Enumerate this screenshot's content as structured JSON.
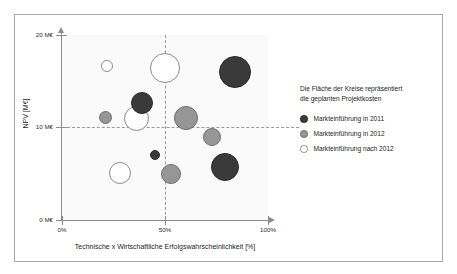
{
  "figure": {
    "background": "#ffffff",
    "border_color": "#a8a8a8",
    "plot_background": "#fafafa"
  },
  "legend": {
    "caption_line1": "Die Fläche der Kreise repräsentiert",
    "caption_line2": "die geplanten Projektkosten",
    "items": [
      {
        "label": "Markteinführung in 2011",
        "color": "#3a3a3a",
        "stroke": "#2a2a2a"
      },
      {
        "label": "Markteinführung in 2012",
        "color": "#969696",
        "stroke": "#6e6e6e"
      },
      {
        "label": "Markteinführung nach 2012",
        "color": "#ffffff",
        "stroke": "#8c8c8c"
      }
    ]
  },
  "axes": {
    "y_title": "NPV [M€]",
    "x_title": "Technische x Wirtschaftliche Erfolgswahrscheinlichkeit [%]",
    "y_ticks": [
      "20 M€",
      "10 M€",
      "0 M€"
    ],
    "x_ticks": [
      "0%",
      "50%",
      "100%"
    ],
    "guide_y_value": "10 M€",
    "guide_x_value": "50%"
  },
  "chart_data": {
    "type": "scatter",
    "title": "",
    "subtitle": "",
    "xlabel": "Technische x Wirtschaftliche Erfolgswahrscheinlichkeit [%]",
    "ylabel": "NPV [M€]",
    "xlim": [
      0,
      100
    ],
    "ylim": [
      0,
      20
    ],
    "xticks": [
      0,
      50,
      100
    ],
    "yticks": [
      0,
      10,
      20
    ],
    "xtick_labels": [
      "0%",
      "50%",
      "100%"
    ],
    "ytick_labels": [
      "0 M€",
      "10 M€",
      "20 M€"
    ],
    "grid": false,
    "reference_lines": [
      {
        "axis": "y",
        "value": 10,
        "style": "dashed"
      },
      {
        "axis": "x",
        "value": 50,
        "style": "dashed"
      }
    ],
    "legend_position": "right",
    "size_encodes": "geplante Projektkosten (Kreisfläche)",
    "series": [
      {
        "name": "Markteinführung in 2011",
        "color": "#3a3a3a",
        "points": [
          {
            "x": 39,
            "y": 12.7,
            "r": 11
          },
          {
            "x": 84,
            "y": 16.0,
            "r": 16
          },
          {
            "x": 45,
            "y": 7.0,
            "r": 5
          },
          {
            "x": 79,
            "y": 5.7,
            "r": 14
          }
        ]
      },
      {
        "name": "Markteinführung in 2012",
        "color": "#969696",
        "points": [
          {
            "x": 21,
            "y": 11.1,
            "r": 6.5
          },
          {
            "x": 60,
            "y": 11.0,
            "r": 12
          },
          {
            "x": 73,
            "y": 9.0,
            "r": 9
          },
          {
            "x": 53,
            "y": 5.0,
            "r": 10
          }
        ]
      },
      {
        "name": "Markteinführung nach 2012",
        "color": "#ffffff",
        "points": [
          {
            "x": 22,
            "y": 16.7,
            "r": 6
          },
          {
            "x": 50,
            "y": 16.4,
            "r": 15
          },
          {
            "x": 36,
            "y": 11.0,
            "r": 12.5
          },
          {
            "x": 28,
            "y": 5.1,
            "r": 11
          }
        ]
      }
    ]
  }
}
